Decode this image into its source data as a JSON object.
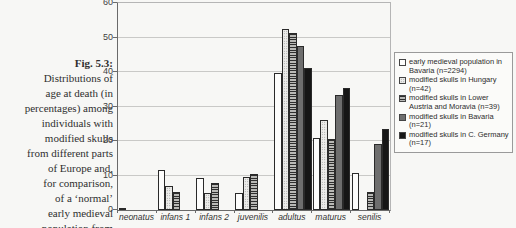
{
  "figure": {
    "caption_lines": [
      "Fig. 5.3:",
      "Distributions of",
      "age at death (in",
      "percentages) among",
      "individuals with",
      "modified skulls",
      "from different parts",
      "of Europe and,",
      "for comparison,",
      "of a ‘normal’",
      "early medieval",
      "population from"
    ]
  },
  "chart_data": {
    "type": "bar",
    "title": "",
    "xlabel": "",
    "ylabel": "",
    "ylim": [
      0,
      60
    ],
    "yticks": [
      0,
      10,
      20,
      30,
      40,
      50,
      60
    ],
    "grid": true,
    "legend_position": "right",
    "categories": [
      "neonatus",
      "infans 1",
      "infans 2",
      "juvenilis",
      "adultus",
      "maturus",
      "senilis"
    ],
    "series": [
      {
        "name": "early medieval population in Bavaria (n=2294)",
        "pattern": "white",
        "values": [
          0.6,
          11.6,
          9.3,
          4.8,
          39.6,
          21.0,
          10.8
        ]
      },
      {
        "name": "modified skulls in Hungary (n=42)",
        "pattern": "dots",
        "values": [
          0,
          7.1,
          4.8,
          9.5,
          52.4,
          26.2,
          0
        ]
      },
      {
        "name": "modified skulls in Lower Austria and Moravia (n=39)",
        "pattern": "hlines",
        "values": [
          0,
          5.1,
          7.7,
          10.3,
          51.3,
          20.5,
          5.1
        ]
      },
      {
        "name": "modified skulls in Bavaria (n=21)",
        "pattern": "gray",
        "values": [
          0,
          0,
          0,
          0,
          47.6,
          33.3,
          19.0
        ]
      },
      {
        "name": "modified skulls in C. Germany (n=17)",
        "pattern": "black",
        "values": [
          0,
          0,
          0,
          0,
          41.2,
          35.3,
          23.5
        ]
      }
    ]
  },
  "colors": {
    "page_bg": "#f7f7f5",
    "grid": "#c9c9c7",
    "axis": "#6a6a6a",
    "bar_border": "#2a2a2a",
    "gray_fill": "#6e6e6e",
    "black_fill": "#161616",
    "dots_base": "#ececea",
    "text": "#2f2f2f"
  }
}
